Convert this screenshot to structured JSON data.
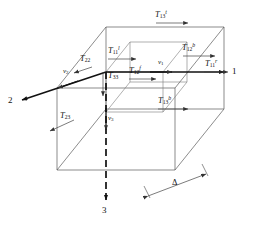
{
  "figure": {
    "type": "3d-control-volume-diagram",
    "background": "#ffffff",
    "line_color": "#555555",
    "bold_line_color": "#1a1a1a",
    "text_color": "#111111"
  },
  "axes": [
    {
      "name": "axis-1",
      "label": "1",
      "x": 231,
      "y": 73,
      "direction": "right"
    },
    {
      "name": "axis-2",
      "label": "2",
      "x": 8,
      "y": 102,
      "direction": "lower-left"
    },
    {
      "name": "axis-3",
      "label": "3",
      "x": 104,
      "y": 209,
      "direction": "down"
    }
  ],
  "velocities": [
    {
      "name": "v1",
      "base": "v",
      "sub": "1",
      "x": 160,
      "y": 60
    },
    {
      "name": "v2",
      "base": "v",
      "sub": "2",
      "x": 65,
      "y": 69
    },
    {
      "name": "v3",
      "base": "v",
      "sub": "3",
      "x": 106,
      "y": 118
    }
  ],
  "stress_labels": [
    {
      "name": "T13-top",
      "base": "T",
      "sub": "13",
      "sup": "t",
      "x": 158,
      "y": 13
    },
    {
      "name": "T12-back",
      "base": "T",
      "sub": "12",
      "sup": "b",
      "x": 185,
      "y": 46
    },
    {
      "name": "T11-right",
      "base": "T",
      "sub": "11",
      "sup": "r",
      "x": 206,
      "y": 61
    },
    {
      "name": "T11-left",
      "base": "T",
      "sub": "11",
      "sup": "l",
      "x": 110,
      "y": 49
    },
    {
      "name": "T22",
      "base": "T",
      "sub": "22",
      "sup": "",
      "x": 82,
      "y": 58
    },
    {
      "name": "T33",
      "base": "T",
      "sub": "33",
      "sup": "",
      "x": 110,
      "y": 73
    },
    {
      "name": "T12-front",
      "base": "T",
      "sub": "12",
      "sup": "f",
      "x": 131,
      "y": 69
    },
    {
      "name": "T13-bottom",
      "base": "T",
      "sub": "13",
      "sup": "b",
      "x": 160,
      "y": 99
    },
    {
      "name": "T23",
      "base": "T",
      "sub": "23",
      "sup": "",
      "x": 62,
      "y": 114
    }
  ],
  "dimension": {
    "name": "delta-dimension",
    "label": "Δ",
    "x": 175,
    "y": 182
  }
}
